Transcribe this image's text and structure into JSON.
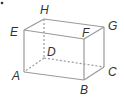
{
  "diagram": {
    "type": "rectangular-prism",
    "vertices": {
      "A": {
        "label": "A",
        "x": 24,
        "y": 72
      },
      "B": {
        "label": "B",
        "x": 84,
        "y": 80
      },
      "C": {
        "label": "C",
        "x": 104,
        "y": 67
      },
      "D": {
        "label": "D",
        "x": 44,
        "y": 58
      },
      "E": {
        "label": "E",
        "x": 24,
        "y": 30
      },
      "F": {
        "label": "F",
        "x": 84,
        "y": 39
      },
      "G": {
        "label": "G",
        "x": 104,
        "y": 27
      },
      "H": {
        "label": "H",
        "x": 44,
        "y": 19
      }
    },
    "solid_edges": [
      "AB",
      "BC",
      "CG",
      "GF",
      "FE",
      "EA",
      "FB",
      "EH",
      "HG"
    ],
    "hidden_edges": [
      "AD",
      "DC",
      "DH"
    ],
    "colors": {
      "edge": "#9a9a9a",
      "label": "#333333"
    }
  }
}
